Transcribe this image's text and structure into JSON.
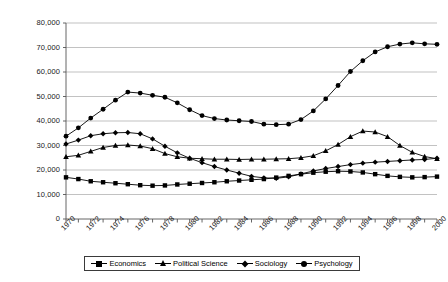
{
  "chart_data": {
    "type": "line",
    "title": "",
    "subtitle": "",
    "xlabel": "",
    "ylabel": "",
    "xlim": [
      1970,
      2000
    ],
    "ylim": [
      0,
      80000
    ],
    "grid": true,
    "legend_position": "bottom",
    "x": [
      1970,
      1971,
      1972,
      1973,
      1974,
      1975,
      1976,
      1977,
      1978,
      1979,
      1980,
      1981,
      1982,
      1983,
      1984,
      1985,
      1986,
      1987,
      1988,
      1989,
      1990,
      1991,
      1992,
      1993,
      1994,
      1995,
      1996,
      1997,
      1998,
      1999,
      2000
    ],
    "xtick_labels": [
      "1970",
      "1972",
      "1974",
      "1976",
      "1978",
      "1980",
      "1982",
      "1984",
      "1986",
      "1988",
      "1990",
      "1992",
      "1994",
      "1996",
      "1998",
      "2000"
    ],
    "ytick_labels": [
      "0",
      "10,000",
      "20,000",
      "30,000",
      "40,000",
      "50,000",
      "60,000",
      "70,000",
      "80,000"
    ],
    "ytick_values": [
      0,
      10000,
      20000,
      30000,
      40000,
      50000,
      60000,
      70000,
      80000
    ],
    "series": [
      {
        "name": "Economics",
        "marker": "square",
        "color": "#000000",
        "values": [
          17000,
          16300,
          15400,
          15000,
          14600,
          14200,
          13800,
          13600,
          13700,
          14100,
          14400,
          14700,
          15000,
          15400,
          15700,
          16000,
          16300,
          16900,
          17600,
          18300,
          18900,
          19300,
          19500,
          19400,
          19000,
          18300,
          17600,
          17200,
          17000,
          17100,
          17300
        ]
      },
      {
        "name": "Political Science",
        "marker": "triangle",
        "color": "#000000",
        "values": [
          25400,
          26000,
          27600,
          29200,
          30000,
          30200,
          29800,
          28700,
          26700,
          25400,
          24800,
          24600,
          24400,
          24400,
          24300,
          24400,
          24400,
          24500,
          24600,
          25000,
          25800,
          27800,
          30400,
          33600,
          35900,
          35500,
          33600,
          30000,
          27200,
          25500,
          24600
        ]
      },
      {
        "name": "Sociology",
        "marker": "diamond",
        "color": "#000000",
        "values": [
          30600,
          32200,
          34000,
          34800,
          35200,
          35300,
          34800,
          32700,
          29700,
          27000,
          24800,
          23000,
          21400,
          20000,
          18700,
          17400,
          16800,
          16600,
          17200,
          18400,
          19600,
          20600,
          21400,
          22200,
          22800,
          23200,
          23500,
          23800,
          24100,
          24300,
          24800
        ]
      },
      {
        "name": "Psychology",
        "marker": "circle",
        "color": "#000000",
        "values": [
          33800,
          37200,
          41200,
          44800,
          48500,
          51800,
          51400,
          50500,
          49700,
          47400,
          44600,
          42200,
          41000,
          40400,
          40100,
          39800,
          38700,
          38500,
          38700,
          40600,
          44100,
          49000,
          54500,
          60200,
          64600,
          68200,
          70300,
          71400,
          71900,
          71500,
          71300
        ]
      }
    ]
  },
  "legend": {
    "items": [
      {
        "label": "Economics",
        "marker": "square"
      },
      {
        "label": "Political Science",
        "marker": "triangle"
      },
      {
        "label": "Sociology",
        "marker": "diamond"
      },
      {
        "label": "Psychology",
        "marker": "circle"
      }
    ]
  }
}
